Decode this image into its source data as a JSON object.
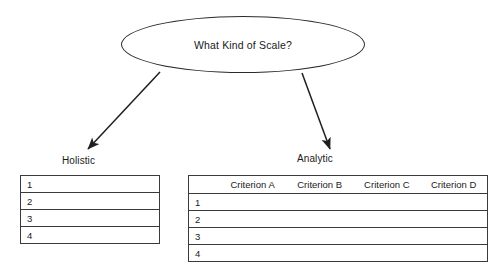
{
  "diagram": {
    "root": {
      "label": "What Kind of Scale?",
      "shape": "ellipse"
    },
    "branches": [
      {
        "label": "Holistic"
      },
      {
        "label": "Analytic"
      }
    ],
    "holistic_table": {
      "rows": [
        "1",
        "2",
        "3",
        "4"
      ]
    },
    "analytic_table": {
      "row_number_header": "",
      "headers": [
        "Criterion A",
        "Criterion B",
        "Criterion C",
        "Criterion D"
      ],
      "rows": [
        "1",
        "2",
        "3",
        "4"
      ]
    },
    "colors": {
      "stroke": "#2b2b2b",
      "table_border": "#3a3a3a",
      "background": "#ffffff",
      "text": "#1a1a1a"
    }
  }
}
